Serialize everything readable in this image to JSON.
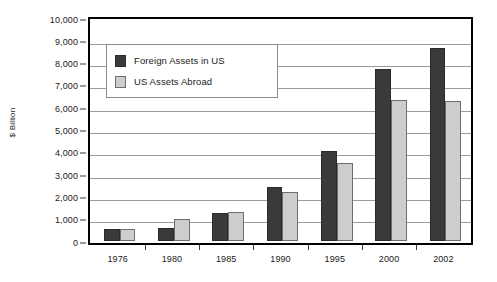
{
  "chart_data": {
    "type": "bar",
    "title": "",
    "subtitle": "",
    "xlabel": "",
    "ylabel": "$ Billion",
    "categories": [
      "1976",
      "1980",
      "1985",
      "1990",
      "1995",
      "2000",
      "2002"
    ],
    "series": [
      {
        "name": "Foreign Assets in US",
        "color": "#3a3a3a",
        "values": [
          510,
          580,
          1240,
          2400,
          4000,
          7700,
          8650
        ]
      },
      {
        "name": "US Assets Abroad",
        "color": "#cdcdcd",
        "values": [
          510,
          960,
          1290,
          2190,
          3480,
          6300,
          6250
        ]
      }
    ],
    "ylim": [
      0,
      10000
    ],
    "ytick_values": [
      0,
      1000,
      2000,
      3000,
      4000,
      5000,
      6000,
      7000,
      8000,
      9000,
      10000
    ],
    "ytick_labels": [
      "0",
      "1,000",
      "2,000",
      "3,000",
      "4,000",
      "5,000",
      "6,000",
      "7,000",
      "8,000",
      "9,000",
      "10,000"
    ],
    "grid": true,
    "grid_axis": "y",
    "legend_position": "upper-left-inside",
    "plot_border_color": "#000000",
    "gridline_color": "#9a9a9a",
    "background_color": "#ffffff"
  }
}
